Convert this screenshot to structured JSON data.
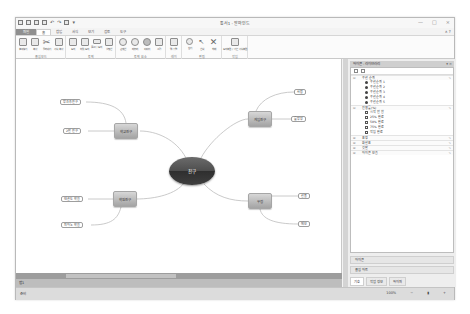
{
  "window": {
    "title": "통서1 - 알마인드",
    "controls": [
      "—",
      "□",
      "×"
    ]
  },
  "quick_access": [
    "app-icon",
    "new-icon",
    "open-icon",
    "save-icon",
    "undo-icon",
    "redo-icon",
    "print-icon",
    "dropdown-icon"
  ],
  "ribbon": {
    "tabs": [
      {
        "label": "파일",
        "type": "file"
      },
      {
        "label": "홈",
        "active": true
      },
      {
        "label": "삽입"
      },
      {
        "label": "서식"
      },
      {
        "label": "보기"
      },
      {
        "label": "검토"
      },
      {
        "label": "도구"
      }
    ],
    "help": "∧ ?",
    "groups": [
      {
        "label": "클립보드",
        "buttons": [
          "붙여넣기",
          "복사",
          "잘라내기",
          "서식 복사"
        ]
      },
      {
        "label": "토픽",
        "buttons": [
          "토픽",
          "하위 토픽",
          "플로팅 토픽",
          "설명선"
        ]
      },
      {
        "label": "토픽 요소",
        "buttons": [
          "관계선",
          "테두리",
          "이미지",
          "그림"
        ]
      },
      {
        "label": "레이",
        "buttons": [
          "맵 정렬"
        ]
      },
      {
        "label": "편집",
        "buttons": [
          "찾기",
          "선택",
          "삭제"
        ]
      },
      {
        "label": "작업",
        "buttons": [
          "토픽 복원 / 기본 서식 복원"
        ]
      }
    ]
  },
  "mindmap": {
    "center": "친구",
    "branches": [
      {
        "label": "학교친구",
        "children": [
          "방과후친구",
          "2반 친구"
        ]
      },
      {
        "label": "게임친구",
        "children": [
          "사람",
          "롤방장"
        ]
      },
      {
        "label": "학원친구",
        "children": [
          "태권도 학원",
          "피아노 학원"
        ]
      },
      {
        "label": "우정",
        "children": [
          "선물",
          "메모"
        ]
      }
    ]
  },
  "sheet": {
    "tab_label": "맵1"
  },
  "status": {
    "left": "준비",
    "zoom": "100%"
  },
  "panel": {
    "title": "아이콘 - 라이브러리",
    "categories": [
      {
        "label": "우선 순위",
        "items": [
          "우선순위 1",
          "우선순위 2",
          "우선순위 3",
          "우선순위 4",
          "우선순위 5"
        ]
      },
      {
        "label": "진행률(%)",
        "items": [
          "시작 안 함",
          "25% 완료",
          "50% 완료",
          "75% 완료",
          "작업 완료"
        ]
      },
      {
        "label": "표정",
        "items": []
      },
      {
        "label": "화살표",
        "items": []
      },
      {
        "label": "깃발",
        "items": []
      },
      {
        "label": "아이콘 모음",
        "items": []
      }
    ],
    "footer_items": [
      "아이콘",
      "클립 아트"
    ],
    "bottom_tabs": [
      "기호",
      "작업 정보",
      "하이퍼"
    ]
  }
}
